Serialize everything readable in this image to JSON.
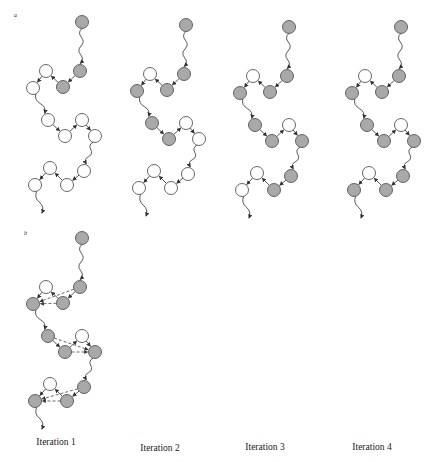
{
  "panels": {
    "a": {
      "label": "a"
    },
    "b": {
      "label": "b"
    }
  },
  "iterations": [
    {
      "label": "Iteration 1",
      "x": 56
    },
    {
      "label": "Iteration 2",
      "x": 160
    },
    {
      "label": "Iteration 3",
      "x": 265
    },
    {
      "label": "Iteration 4",
      "x": 372
    }
  ],
  "colors": {
    "filled": "#a9a9a9",
    "empty": "#ffffff",
    "stroke": "#555555",
    "line": "#444444"
  },
  "chain_template": {
    "start": [
      82,
      22
    ],
    "nodes": [
      [
        80,
        71
      ],
      [
        63,
        87
      ],
      [
        46,
        71
      ],
      [
        33,
        88
      ],
      [
        48,
        120
      ],
      [
        65,
        136
      ],
      [
        82,
        120
      ],
      [
        95,
        136
      ],
      [
        84,
        171
      ],
      [
        67,
        185
      ],
      [
        50,
        168
      ],
      [
        35,
        185
      ]
    ],
    "end": [
      42,
      213
    ]
  },
  "panel_a_chains": [
    {
      "dx": 0,
      "dy": 0,
      "filled": [
        true,
        true,
        false,
        false,
        false,
        false,
        false,
        false,
        false,
        false,
        false,
        false
      ]
    },
    {
      "dx": 104,
      "dy": 3,
      "filled": [
        true,
        true,
        false,
        true,
        true,
        true,
        false,
        false,
        false,
        false,
        false,
        false
      ]
    },
    {
      "dx": 207,
      "dy": 5,
      "filled": [
        true,
        true,
        false,
        true,
        true,
        true,
        false,
        true,
        true,
        true,
        false,
        false
      ]
    },
    {
      "dx": 319,
      "dy": 5,
      "filled": [
        true,
        true,
        false,
        true,
        true,
        true,
        false,
        true,
        true,
        true,
        false,
        true
      ]
    }
  ],
  "panel_b_chain": {
    "dx": 0,
    "dy": 216,
    "filled": [
      true,
      true,
      false,
      true,
      true,
      true,
      false,
      true,
      true,
      true,
      false,
      true
    ],
    "dashed_links": [
      [
        0,
        3
      ],
      [
        1,
        3
      ],
      [
        4,
        7
      ],
      [
        5,
        7
      ],
      [
        8,
        11
      ],
      [
        9,
        11
      ]
    ]
  }
}
